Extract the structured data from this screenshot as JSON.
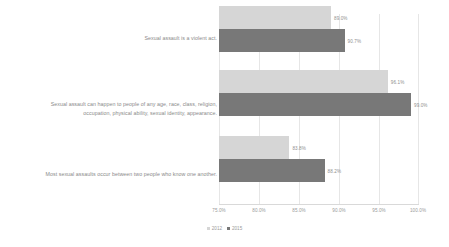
{
  "chart_data": {
    "type": "bar",
    "orientation": "horizontal",
    "title": "",
    "subtitle": "",
    "xlabel": "",
    "ylabel": "",
    "xlim": [
      75.0,
      100.0
    ],
    "grid": true,
    "legend_position": "bottom-center",
    "categories": [
      "Sexual assault is a violent act.",
      "Sexual assault can happen to people of any age, race, class, religion, occupation, physical ability, sexual identity, appearance.",
      "Most sexual assaults occur between two people who know one another."
    ],
    "tick_labels": [
      "75.0%",
      "80.0%",
      "85.0%",
      "90.0%",
      "95.0%",
      "100.0%"
    ],
    "tick_values": [
      75.0,
      80.0,
      85.0,
      90.0,
      95.0,
      100.0
    ],
    "series": [
      {
        "name": "2012",
        "color": "#d6d6d6",
        "values": [
          89.0,
          96.1,
          83.8
        ],
        "value_labels": [
          "89.0%",
          "96.1%",
          "83.8%"
        ]
      },
      {
        "name": "2015",
        "color": "#787878",
        "values": [
          90.7,
          99.0,
          88.2
        ],
        "value_labels": [
          "90.7%",
          "99.0%",
          "88.2%"
        ]
      }
    ]
  }
}
